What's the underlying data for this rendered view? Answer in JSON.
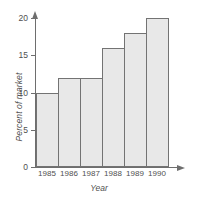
{
  "chart_data": {
    "type": "bar",
    "title": "",
    "xlabel": "Year",
    "ylabel": "Percent of market",
    "categories": [
      "1985",
      "1986",
      "1987",
      "1988",
      "1989",
      "1990"
    ],
    "values": [
      10,
      12,
      12,
      16,
      18,
      20
    ],
    "ylim": [
      0,
      20
    ],
    "yticks": [
      0,
      5,
      10,
      15,
      20
    ],
    "ytick_labels": [
      "0",
      "5",
      "10",
      "15",
      "20"
    ],
    "grid": false,
    "legend": null,
    "bar_fill_color": "#e8e8e8",
    "bar_border_color": "#737373",
    "axis_color": "#6e6e6e",
    "text_color": "#4f4f4f",
    "background_color": "#ffffff"
  }
}
